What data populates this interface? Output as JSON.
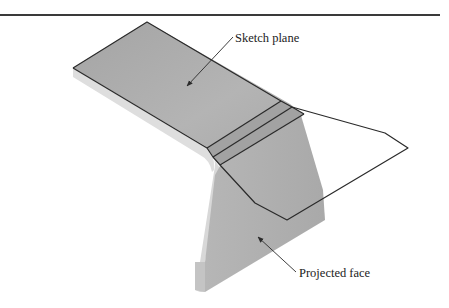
{
  "figure": {
    "labels": {
      "sketch_plane": "Sketch plane",
      "projected_face": "Projected face"
    },
    "colors": {
      "face_top": "#a9a9a9",
      "face_side_light": "#dcdcdc",
      "face_vertical": "#b0b0b0",
      "outline": "#2a2a2a",
      "rule": "#3a3a3a"
    }
  }
}
